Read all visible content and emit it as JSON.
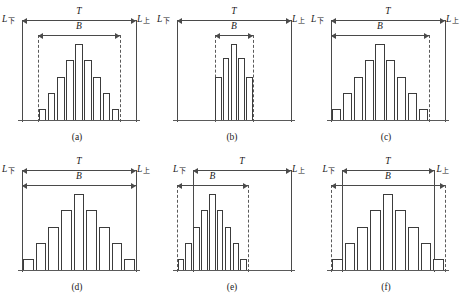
{
  "figure": {
    "label_lower": "L",
    "label_lower_sub": "下",
    "label_upper": "L",
    "label_upper_sub": "上",
    "dim_tolerance": "T",
    "dim_spread": "B",
    "line_color": "#3c3c3c",
    "arrow_color": "#4a4a4a",
    "background": "#ffffff"
  },
  "chart_data": {
    "type": "bar",
    "title": "",
    "xlabel": "",
    "ylabel": "",
    "grid": false,
    "legend": false,
    "panels": [
      {
        "caption": "(a)",
        "values": [
          1.0,
          2.5,
          4.0,
          5.5,
          7.0,
          5.5,
          4.0,
          2.5,
          1.0
        ],
        "n_bars": 9,
        "tolerance_span": [
          0.0,
          100.0
        ],
        "spread_span": [
          14.0,
          86.0
        ],
        "tolerance_line_style": [
          "solid",
          "solid"
        ],
        "spread_line_style": [
          "dashed",
          "dashed"
        ],
        "note": "B fully inside T, centered"
      },
      {
        "caption": "(b)",
        "values": [
          4.2,
          6.0,
          7.4,
          6.0,
          4.2
        ],
        "n_bars": 5,
        "tolerance_span": [
          0.0,
          100.0
        ],
        "spread_span": [
          33.0,
          67.0
        ],
        "tolerance_line_style": [
          "solid",
          "solid"
        ],
        "spread_line_style": [
          "dashed",
          "dashed"
        ],
        "note": "B much narrower than T, centered"
      },
      {
        "caption": "(c)",
        "values": [
          1.0,
          2.5,
          4.0,
          5.5,
          7.0,
          5.5,
          4.0,
          2.5,
          1.0
        ],
        "n_bars": 9,
        "tolerance_span": [
          0.0,
          100.0
        ],
        "spread_span": [
          0.0,
          86.0
        ],
        "tolerance_line_style": [
          "solid",
          "solid"
        ],
        "spread_line_style": [
          "solid",
          "dashed"
        ],
        "note": "B starts at lower limit, ends inside T"
      },
      {
        "caption": "(d)",
        "values": [
          1.0,
          2.5,
          4.0,
          5.5,
          7.0,
          5.5,
          4.0,
          2.5,
          1.0
        ],
        "n_bars": 9,
        "tolerance_span": [
          0.0,
          100.0
        ],
        "spread_span": [
          0.0,
          100.0
        ],
        "tolerance_line_style": [
          "solid",
          "solid"
        ],
        "spread_line_style": [
          "solid",
          "solid"
        ],
        "note": "B equals T exactly"
      },
      {
        "caption": "(e)",
        "values": [
          1.0,
          2.5,
          4.0,
          5.5,
          7.0,
          5.5,
          4.0,
          2.5,
          1.0
        ],
        "n_bars": 9,
        "tolerance_span": [
          14.0,
          100.0
        ],
        "spread_span": [
          0.0,
          62.0
        ],
        "tolerance_line_style": [
          "solid",
          "solid"
        ],
        "spread_line_style": [
          "dashed",
          "dashed"
        ],
        "note": "B shifted left, extends past lower limit of T"
      },
      {
        "caption": "(f)",
        "values": [
          1.0,
          2.5,
          4.0,
          5.5,
          7.0,
          5.5,
          4.0,
          2.5,
          1.0
        ],
        "n_bars": 9,
        "tolerance_span": [
          10.0,
          90.0
        ],
        "spread_span": [
          0.0,
          100.0
        ],
        "tolerance_line_style": [
          "solid",
          "solid"
        ],
        "spread_line_style": [
          "dashed",
          "dashed"
        ],
        "note": "B wider than T on both sides"
      }
    ]
  }
}
